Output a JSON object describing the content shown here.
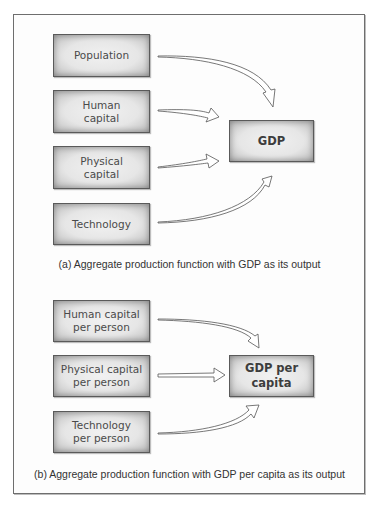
{
  "panel_a": {
    "inputs": [
      {
        "label": "Population"
      },
      {
        "label": "Human capital"
      },
      {
        "label": "Physical capital"
      },
      {
        "label": "Technology"
      }
    ],
    "output": {
      "label": "GDP"
    },
    "caption": "(a) Aggregate production function with GDP as its output"
  },
  "panel_b": {
    "inputs": [
      {
        "label": "Human capital per person"
      },
      {
        "label": "Physical capital per person"
      },
      {
        "label": "Technology per person"
      }
    ],
    "output": {
      "label": "GDP per capita"
    },
    "caption": "(b) Aggregate production function with GDP per capita as its output"
  },
  "colors": {
    "box_border": "#5a5a5a",
    "box_fill": "#e6e6e6",
    "frame_border": "#6e6e6e",
    "text": "#4a4a4a"
  }
}
